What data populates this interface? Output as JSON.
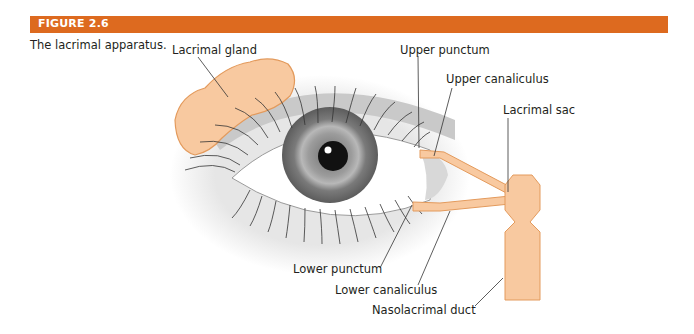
{
  "figure": {
    "number": "FIGURE 2.6",
    "caption": "The lacrimal apparatus.",
    "accent_color": "#dd6a1f"
  },
  "diagram": {
    "labels": {
      "lacrimal_gland": "Lacrimal gland",
      "upper_punctum": "Upper punctum",
      "upper_canaliculus": "Upper canaliculus",
      "lacrimal_sac": "Lacrimal sac",
      "lower_punctum": "Lower punctum",
      "lower_canaliculus": "Lower canaliculus",
      "nasolacrimal_duct": "Nasolacrimal duct"
    },
    "colors": {
      "tissue_fill": "#f8c9a0",
      "tissue_stroke": "#e39a5c",
      "iris": "#8a8a8a",
      "pupil": "#111111",
      "leader_line": "#333333"
    }
  }
}
